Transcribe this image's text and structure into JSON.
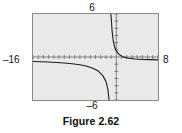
{
  "figure": {
    "caption": "Figure 2.62"
  },
  "window_labels": {
    "ymax": "6",
    "ymin": "–6",
    "xmin": "–16",
    "xmax": "8"
  },
  "chart_data": {
    "type": "line",
    "title": "Figure 2.62",
    "xlabel": "",
    "ylabel": "",
    "xlim": [
      -16,
      8
    ],
    "ylim": [
      -6,
      6
    ],
    "grid": false,
    "legend": null,
    "axes": {
      "x_axis_visible": true,
      "y_axis_visible": true,
      "x_tick_spacing": 1,
      "y_tick_spacing": 1,
      "tick_marks": "short hash marks along both axes"
    },
    "annotations": [
      "vertical asymptote near x = -1",
      "horizontal asymptote near y = -0.4"
    ],
    "series": [
      {
        "name": "upper-right branch",
        "comment": "decreasing branch right of the vertical asymptote, falling from y = 6 toward the horizontal asymptote y ≈ -0.4 as x → 8",
        "x": [
          -1.05,
          -0.95,
          -0.8,
          -0.6,
          -0.3,
          0.0,
          0.6,
          1.4,
          2.4,
          3.6,
          5.0,
          6.4,
          8.0
        ],
        "y": [
          6.0,
          5.1,
          3.5,
          2.3,
          1.35,
          0.85,
          0.3,
          -0.02,
          -0.18,
          -0.28,
          -0.34,
          -0.37,
          -0.4
        ]
      },
      {
        "name": "lower-left branch",
        "comment": "decreasing branch left of the vertical asymptote, running from y ≈ -0.6 at x = -16 down to y = -6 near x = -1.4",
        "x": [
          -16.0,
          -14.5,
          -13.0,
          -11.5,
          -10.0,
          -8.5,
          -7.0,
          -5.6,
          -4.4,
          -3.4,
          -2.6,
          -2.0,
          -1.6,
          -1.4
        ],
        "y": [
          -0.62,
          -0.66,
          -0.7,
          -0.76,
          -0.84,
          -0.94,
          -1.08,
          -1.3,
          -1.6,
          -2.0,
          -2.6,
          -3.4,
          -4.6,
          -6.0
        ]
      }
    ]
  },
  "colors": {
    "screen_background": "#e9e9e9",
    "screen_border": "#8a8a8a",
    "curve": "#1c1c1c",
    "axis": "#5a5a5a",
    "text": "#121212",
    "page_background": "#ffffff"
  }
}
